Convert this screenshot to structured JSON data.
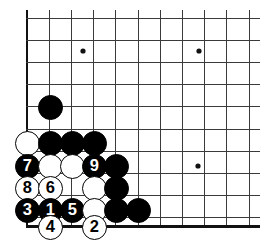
{
  "figure": {
    "kind": "go-board-diagram",
    "background_color": "#ffffff",
    "line_color": "#3a3a3a",
    "edge_color": "#111111",
    "black_color": "#000000",
    "white_color": "#ffffff"
  },
  "board": {
    "origin_x": 27,
    "origin_y": 18,
    "spacing": 22.2,
    "cols": 11,
    "rows": 10,
    "edges": {
      "left": true,
      "top": false,
      "bottom": true,
      "right": false
    },
    "star_points": [
      {
        "col": 0,
        "row": 0,
        "x": 83,
        "y": 51
      },
      {
        "col": 0,
        "row": 0,
        "x": 199,
        "y": 51
      },
      {
        "col": 0,
        "row": 0,
        "x": 198,
        "y": 166
      }
    ]
  },
  "stones": [
    {
      "id": "b-free-1",
      "color": "black",
      "label": "",
      "x": 50,
      "y": 107,
      "r": 12.5
    },
    {
      "id": "w-a1",
      "color": "white",
      "label": "",
      "x": 27,
      "y": 143,
      "r": 12.5
    },
    {
      "id": "b-a2",
      "color": "black",
      "label": "",
      "x": 50,
      "y": 143,
      "r": 12.5
    },
    {
      "id": "b-a3",
      "color": "black",
      "label": "",
      "x": 72,
      "y": 143,
      "r": 12.5
    },
    {
      "id": "b-a4",
      "color": "black",
      "label": "",
      "x": 94,
      "y": 143,
      "r": 12.5
    },
    {
      "id": "move-7",
      "color": "black",
      "label": "7",
      "x": 27,
      "y": 166,
      "r": 12.5
    },
    {
      "id": "w-b2",
      "color": "white",
      "label": "",
      "x": 50,
      "y": 166,
      "r": 12.5
    },
    {
      "id": "w-b3",
      "color": "white",
      "label": "",
      "x": 72,
      "y": 166,
      "r": 12.5
    },
    {
      "id": "move-9",
      "color": "black",
      "label": "9",
      "x": 94,
      "y": 166,
      "r": 12.5
    },
    {
      "id": "b-b5",
      "color": "black",
      "label": "",
      "x": 116,
      "y": 166,
      "r": 12.5
    },
    {
      "id": "move-8",
      "color": "white",
      "label": "8",
      "x": 27,
      "y": 188,
      "r": 12.5
    },
    {
      "id": "move-6",
      "color": "white",
      "label": "6",
      "x": 50,
      "y": 188,
      "r": 12.5
    },
    {
      "id": "w-c4",
      "color": "white",
      "label": "",
      "x": 94,
      "y": 188,
      "r": 12.5
    },
    {
      "id": "b-c5",
      "color": "black",
      "label": "",
      "x": 116,
      "y": 188,
      "r": 12.5
    },
    {
      "id": "move-3",
      "color": "black",
      "label": "3",
      "x": 27,
      "y": 210,
      "r": 12.5
    },
    {
      "id": "move-1",
      "color": "black",
      "label": "1",
      "x": 50,
      "y": 210,
      "r": 12.5
    },
    {
      "id": "move-5",
      "color": "black",
      "label": "5",
      "x": 72,
      "y": 210,
      "r": 12.5
    },
    {
      "id": "w-d4",
      "color": "white",
      "label": "",
      "x": 94,
      "y": 210,
      "r": 12.5
    },
    {
      "id": "b-d5",
      "color": "black",
      "label": "",
      "x": 116,
      "y": 210,
      "r": 12.5
    },
    {
      "id": "b-free-2",
      "color": "black",
      "label": "",
      "x": 138,
      "y": 210,
      "r": 12.5
    },
    {
      "id": "move-4",
      "color": "white",
      "label": "4",
      "x": 50,
      "y": 227,
      "r": 12.5
    },
    {
      "id": "move-2",
      "color": "white",
      "label": "2",
      "x": 94,
      "y": 227,
      "r": 12.5
    }
  ],
  "move_numbers": [
    "1",
    "2",
    "3",
    "4",
    "5",
    "6",
    "7",
    "8",
    "9"
  ]
}
